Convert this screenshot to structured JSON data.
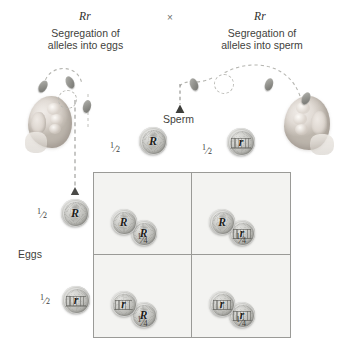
{
  "figure": {
    "title_left_genotype": "Rr",
    "cross_symbol": "×",
    "title_right_genotype": "Rr",
    "caption_left": "Segregation of\nalleles into eggs",
    "caption_left_line1": "Segregation of",
    "caption_left_line2": "alleles into eggs",
    "caption_right_line1": "Segregation of",
    "caption_right_line2": "alleles into sperm",
    "sperm_label": "Sperm",
    "eggs_label": "Eggs",
    "colors": {
      "coin_light": "#e3e3e0",
      "coin_mid": "#c9c9c5",
      "coin_dark": "#8e8e89",
      "grid_fill": "#f3f3f1",
      "grid_border": "#9a9a97",
      "text": "#3a3a38",
      "dash": "#6f6f6c"
    },
    "gametes": {
      "sperm": [
        {
          "fraction_numer": "1",
          "fraction_denom": "2",
          "allele": "R",
          "coin_face": "heads"
        },
        {
          "fraction_numer": "1",
          "fraction_denom": "2",
          "allele": "r",
          "coin_face": "tails"
        }
      ],
      "eggs": [
        {
          "fraction_numer": "1",
          "fraction_denom": "2",
          "allele": "R",
          "coin_face": "heads"
        },
        {
          "fraction_numer": "1",
          "fraction_denom": "2",
          "allele": "r",
          "coin_face": "tails"
        }
      ]
    },
    "punnett_cells": [
      {
        "id": "cell-rr-dominant",
        "coin_a": {
          "allele": "R",
          "coin_face": "heads"
        },
        "coin_b": {
          "allele": "R",
          "coin_face": "heads"
        },
        "fraction_numer": "1",
        "fraction_denom": "4"
      },
      {
        "id": "cell-rr-hetero-top",
        "coin_a": {
          "allele": "R",
          "coin_face": "heads"
        },
        "coin_b": {
          "allele": "r",
          "coin_face": "tails"
        },
        "fraction_numer": "1",
        "fraction_denom": "4"
      },
      {
        "id": "cell-rr-hetero-bottom",
        "coin_a": {
          "allele": "r",
          "coin_face": "tails"
        },
        "coin_b": {
          "allele": "R",
          "coin_face": "heads"
        },
        "fraction_numer": "1",
        "fraction_denom": "4"
      },
      {
        "id": "cell-rr-recessive",
        "coin_a": {
          "allele": "r",
          "coin_face": "tails"
        },
        "coin_b": {
          "allele": "r",
          "coin_face": "tails"
        },
        "fraction_numer": "1",
        "fraction_denom": "4"
      }
    ],
    "icons": {
      "hand_left": "fist-flipping-coin-icon",
      "hand_right": "fist-flipping-coin-icon",
      "arrow_down_egg": "arrow-down-icon",
      "arrow_down_sperm": "arrow-down-icon",
      "coin_toss_path": "dashed-arc-icon"
    }
  }
}
